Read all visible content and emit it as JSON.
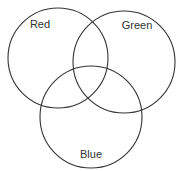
{
  "diagram": {
    "type": "venn",
    "stroke_color": "#333333",
    "background": "#ffffff",
    "sets": [
      {
        "name": "Red",
        "cx": 58,
        "cy": 58,
        "r": 50,
        "label_x": 40,
        "label_y": 28
      },
      {
        "name": "Green",
        "cx": 124,
        "cy": 62,
        "r": 51,
        "label_x": 137,
        "label_y": 29
      },
      {
        "name": "Blue",
        "cx": 91,
        "cy": 117,
        "r": 51,
        "label_x": 91,
        "label_y": 158
      }
    ]
  }
}
